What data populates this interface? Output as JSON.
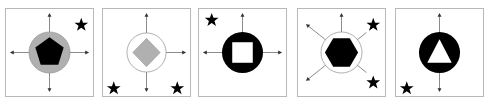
{
  "puzzle": {
    "description": "Sequence of five figure panels, each a circle containing a polygon, with arrows and stars",
    "panels": [
      {
        "index": 1,
        "circle_fill": "#b0b0b0",
        "shape": "pentagon",
        "shape_fill": "#000000",
        "arrows": [
          "up",
          "down",
          "left",
          "right"
        ],
        "stars": [
          "top-right"
        ]
      },
      {
        "index": 2,
        "circle_fill": "#ffffff",
        "shape": "diamond",
        "shape_fill": "#b0b0b0",
        "arrows": [
          "up",
          "down",
          "right"
        ],
        "stars": [
          "bottom-left",
          "bottom-right"
        ]
      },
      {
        "index": 3,
        "circle_fill": "#000000",
        "shape": "square",
        "shape_fill": "#ffffff",
        "arrows": [
          "up",
          "left",
          "right"
        ],
        "stars": [
          "top-left"
        ]
      },
      {
        "index": 4,
        "circle_fill": "#ffffff",
        "shape": "hexagon",
        "shape_fill": "#000000",
        "arrows": [
          "up",
          "up-left",
          "up-right",
          "down-left",
          "down-right"
        ],
        "stars": [
          "top-right",
          "bottom-right"
        ]
      },
      {
        "index": 5,
        "circle_fill": "#000000",
        "shape": "triangle",
        "shape_fill": "#ffffff",
        "arrows": [
          "up",
          "down"
        ],
        "stars": [
          "bottom-left"
        ]
      }
    ]
  },
  "colors": {
    "border": "#b8b8b8",
    "line": "#888888",
    "gray": "#b0b0b0",
    "black": "#000000"
  }
}
